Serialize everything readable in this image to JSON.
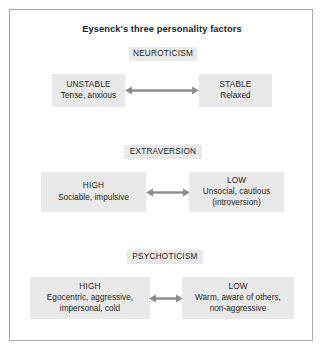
{
  "figure": {
    "title": "Eysenck's three personality factors",
    "colors": {
      "box_fill": "#e9e9e9",
      "box_shadow": "#aeaeae",
      "frame_border": "#a9a9a9",
      "arrow": "#8d8d8d",
      "text": "#231f20",
      "background": "#ffffff"
    }
  },
  "rows": [
    {
      "factor": "NEUROTICISM",
      "left": {
        "head": "UNSTABLE",
        "desc": "Tense, anxious"
      },
      "right": {
        "head": "STABLE",
        "desc": "Relaxed"
      },
      "arrow": "double-headed-arrow"
    },
    {
      "factor": "EXTRAVERSION",
      "left": {
        "head": "HIGH",
        "desc": "Sociable, impulsive"
      },
      "right": {
        "head": "LOW",
        "desc": "Unsocial, cautious\n(introversion)"
      },
      "arrow": "double-headed-arrow"
    },
    {
      "factor": "PSYCHOTICISM",
      "left": {
        "head": "HIGH",
        "desc": "Egocentric, aggressive,\nimpersonal, cold"
      },
      "right": {
        "head": "LOW",
        "desc": "Warm, aware of others,\nnon-aggressive"
      },
      "arrow": "double-headed-arrow"
    }
  ]
}
